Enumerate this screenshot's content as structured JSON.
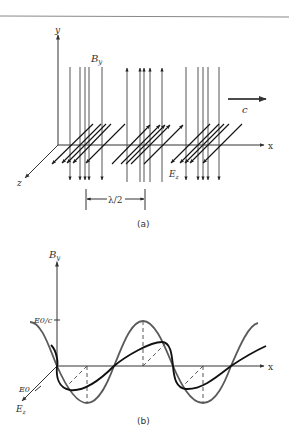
{
  "figure": {
    "top_rule": true,
    "panel_a": {
      "caption": "(a)",
      "axis_labels": {
        "y": "y",
        "x": "x",
        "z": "z"
      },
      "field_labels": {
        "b": "B",
        "b_sub": "y",
        "e": "E",
        "e_sub": "z"
      },
      "velocity_label": "c",
      "wavelength_label": "λ/2"
    },
    "panel_b": {
      "caption": "(b)",
      "axis_labels": {
        "vertical": "B",
        "vertical_sub": "y",
        "x": "x",
        "depth": "E",
        "depth_sub": "z"
      },
      "tick_labels": {
        "b_amplitude": "E0/c",
        "e_amplitude": "E0"
      }
    },
    "colors": {
      "ink": "#333333",
      "b_field": "#5a5a5a",
      "e_field": "#111111",
      "rule": "#888888"
    }
  }
}
